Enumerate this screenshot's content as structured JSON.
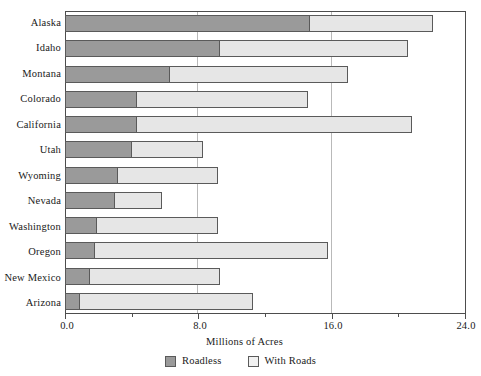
{
  "chart_data": {
    "type": "bar",
    "orientation": "horizontal",
    "stacked": true,
    "title": "",
    "xlabel": "Millions of Acres",
    "ylabel": "",
    "xlim": [
      0.0,
      24.0
    ],
    "xticks": [
      0.0,
      8.0,
      16.0,
      24.0
    ],
    "xticklabels": [
      "0.0",
      "8.0",
      "16.0",
      "24.0"
    ],
    "grid": "vertical-major",
    "legend_position": "bottom-center",
    "categories": [
      "Alaska",
      "Idaho",
      "Montana",
      "Colorado",
      "California",
      "Utah",
      "Wyoming",
      "Nevada",
      "Washington",
      "Oregon",
      "New Mexico",
      "Arizona"
    ],
    "series": [
      {
        "name": "Roadless",
        "color": "#9a9a9a",
        "values": [
          14.7,
          9.3,
          6.3,
          4.3,
          4.3,
          4.0,
          3.2,
          3.0,
          1.9,
          1.8,
          1.5,
          0.9
        ]
      },
      {
        "name": "With Roads",
        "color": "#e6e6e6",
        "values": [
          7.4,
          11.3,
          10.7,
          10.3,
          16.5,
          4.3,
          6.0,
          2.8,
          7.3,
          14.0,
          7.8,
          10.4
        ]
      }
    ],
    "totals": [
      22.1,
      20.6,
      17.0,
      14.6,
      20.8,
      8.3,
      9.2,
      5.8,
      9.2,
      15.8,
      9.3,
      11.3
    ]
  },
  "axis": {
    "x_title": "Millions of Acres",
    "tick_labels": [
      "0.0",
      "8.0",
      "16.0",
      "24.0"
    ],
    "tick_values": [
      0,
      8,
      16,
      24
    ]
  },
  "legend": {
    "entries": [
      {
        "label": "Roadless",
        "color": "#9a9a9a"
      },
      {
        "label": "With Roads",
        "color": "#f1f1f1"
      }
    ]
  },
  "labels": {
    "y": [
      "Alaska",
      "Idaho",
      "Montana",
      "Colorado",
      "California",
      "Utah",
      "Wyoming",
      "Nevada",
      "Washington",
      "Oregon",
      "New Mexico",
      "Arizona"
    ]
  }
}
